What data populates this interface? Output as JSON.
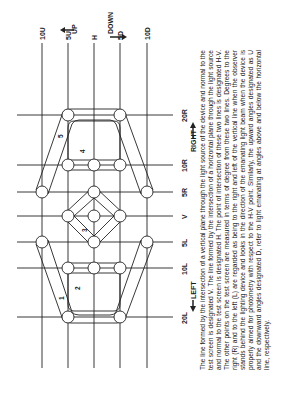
{
  "diagram": {
    "orientation": "rotated-90-ccw",
    "vertical_axis_labels": [
      {
        "id": "10U",
        "label": "10U"
      },
      {
        "id": "5U",
        "label": "5U"
      },
      {
        "id": "H",
        "label": "H"
      },
      {
        "id": "5D",
        "label": "5D"
      },
      {
        "id": "10D",
        "label": "10D"
      }
    ],
    "horizontal_axis_labels": [
      {
        "id": "20R",
        "label": "20R"
      },
      {
        "id": "10R",
        "label": "10R"
      },
      {
        "id": "5R",
        "label": "5R"
      },
      {
        "id": "V",
        "label": "V"
      },
      {
        "id": "5L",
        "label": "5L"
      },
      {
        "id": "10L",
        "label": "10L"
      },
      {
        "id": "20L",
        "label": "20L"
      }
    ],
    "direction_labels": {
      "up": "UP",
      "down": "DOWN",
      "right": "RIGHT",
      "left": "LEFT"
    },
    "zones": [
      "1",
      "2",
      "3",
      "4",
      "5"
    ],
    "test_points": [
      "5U-20R",
      "5D-20R",
      "5U-10R",
      "H-10R",
      "5D-10R",
      "10U-5R",
      "H-5R",
      "10D-5R",
      "5U-V",
      "H-V",
      "5D-V",
      "10U-5L",
      "H-5L",
      "10D-5L",
      "5U-10L",
      "H-10L",
      "5D-10L",
      "5U-20L",
      "5D-20L"
    ]
  },
  "caption": "The line formed by the intersection of a vertical plane through the light source of the device and normal to the test screen is designated V. The line formed by the intersection of a horizontal plane through the light source and normal to the test screen is designated H. The point of intersection of these two lines is designated H-V. The other points on the test screen are measured in terms of degree from these two lines. Degrees to the right (R) and to the left (L) are regarded as being to the right and left of the vertical line when the observer stands behind the lighting device and looks in the direction of the emanating light beam when the device is properly aimed for photometry with respect to the H-V point. Similarly, the upward angles designated as U and the downward angles designated D, refer to light emanating at angles above and below the horizontal line, respectively."
}
